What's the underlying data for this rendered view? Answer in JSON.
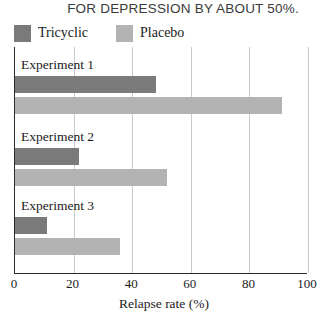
{
  "title": {
    "text": "FOR DEPRESSION BY ABOUT 50%."
  },
  "legend": {
    "position": "top-left",
    "items": [
      {
        "label": "Tricyclic",
        "color": "#7a7a7a"
      },
      {
        "label": "Placebo",
        "color": "#b3b3b3"
      }
    ]
  },
  "axis": {
    "xlabel": "Relapse rate (%)",
    "ticks": [
      "0",
      "20",
      "40",
      "60",
      "80",
      "100"
    ],
    "min": 0,
    "max": 100
  },
  "chart_data": {
    "type": "bar",
    "orientation": "horizontal",
    "title": "FOR DEPRESSION BY ABOUT 50%.",
    "xlabel": "Relapse rate (%)",
    "ylabel": "",
    "xlim": [
      0,
      100
    ],
    "xticks": [
      0,
      20,
      40,
      60,
      80,
      100
    ],
    "grid": "vertical",
    "legend_position": "top-left",
    "categories": [
      "Experiment 1",
      "Experiment 2",
      "Experiment 3"
    ],
    "series": [
      {
        "name": "Tricyclic",
        "color": "#7a7a7a",
        "values": [
          48,
          22,
          11
        ]
      },
      {
        "name": "Placebo",
        "color": "#b3b3b3",
        "values": [
          91,
          52,
          36
        ]
      }
    ]
  }
}
